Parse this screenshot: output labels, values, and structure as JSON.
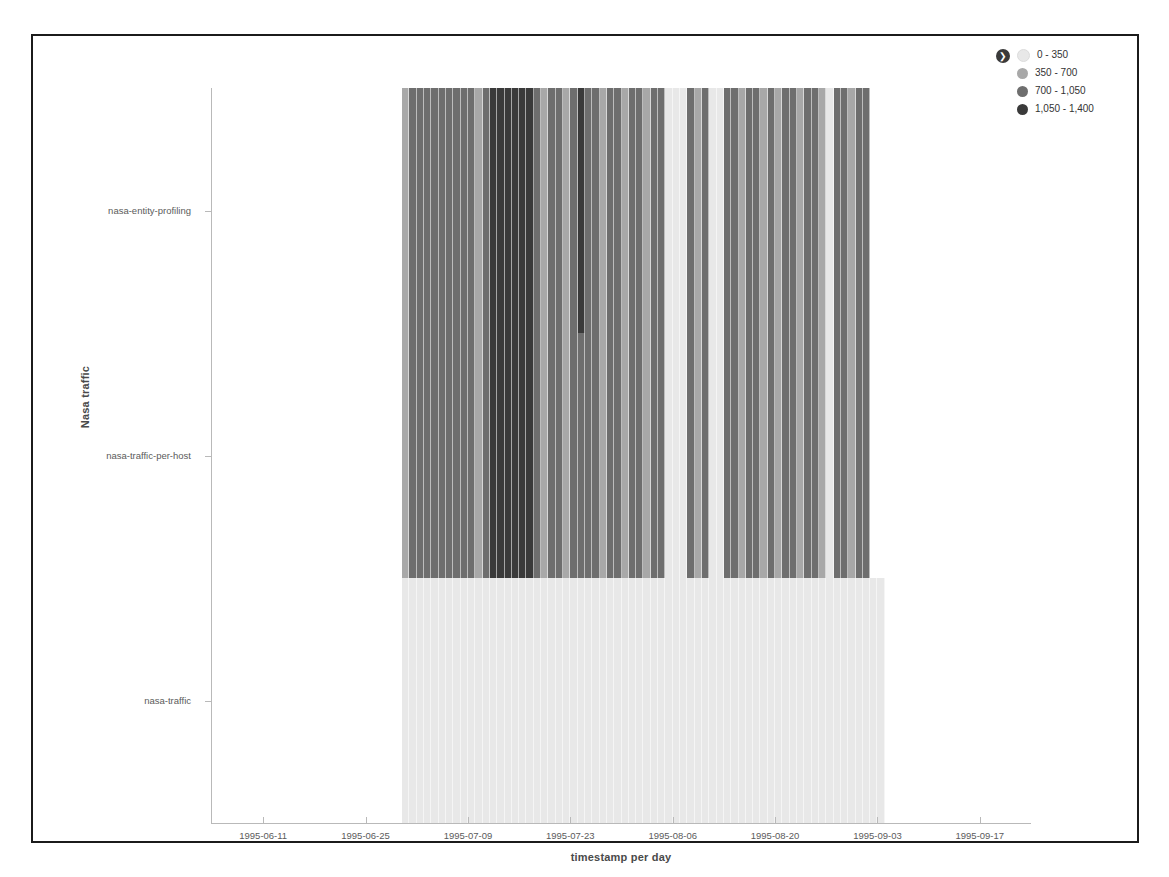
{
  "chart_data": {
    "type": "heatmap",
    "title": "",
    "xlabel": "timestamp per day",
    "ylabel": "Nasa traffic",
    "grid": false,
    "legend_position": "top-right",
    "x_tick_labels": [
      "1995-06-11",
      "1995-06-25",
      "1995-07-09",
      "1995-07-23",
      "1995-08-06",
      "1995-08-20",
      "1995-09-03",
      "1995-09-17"
    ],
    "x_axis_range": [
      "1995-06-04",
      "1995-09-24"
    ],
    "y_categories": [
      "nasa-entity-profiling",
      "nasa-traffic-per-host",
      "nasa-traffic"
    ],
    "value_unit": "requests",
    "color_bands": [
      {
        "label": "0 - 350",
        "min": 0,
        "max": 350,
        "color": "#e8e8e8"
      },
      {
        "label": "350 - 700",
        "min": 350,
        "max": 700,
        "color": "#a8a8a8"
      },
      {
        "label": "700 - 1,050",
        "min": 700,
        "max": 1050,
        "color": "#6e6e6e"
      },
      {
        "label": "1,050 - 1,400",
        "min": 1050,
        "max": 1400,
        "color": "#3a3a3a"
      }
    ],
    "data_start_date": "1995-06-30",
    "data_end_date": "1995-09-01",
    "series": [
      {
        "name": "nasa-entity-profiling",
        "values": [
          640,
          700,
          1010,
          1020,
          1030,
          1010,
          1000,
          1020,
          1040,
          1020,
          680,
          700,
          1060,
          1080,
          1100,
          1120,
          1300,
          1320,
          700,
          690,
          710,
          700,
          690,
          700,
          1080,
          700,
          700,
          690,
          700,
          700,
          690,
          700,
          700,
          690,
          700,
          700,
          330,
          300,
          320,
          700,
          690,
          700,
          300,
          310,
          700,
          700,
          690,
          700,
          700,
          690,
          700,
          690,
          700,
          700,
          690,
          700,
          700,
          690,
          320,
          700,
          700,
          690,
          1030,
          1040
        ]
      },
      {
        "name": "nasa-traffic-per-host",
        "values": [
          640,
          700,
          1010,
          1020,
          1030,
          1010,
          1000,
          1020,
          1040,
          1020,
          680,
          700,
          1060,
          1080,
          1100,
          1120,
          1300,
          1320,
          700,
          690,
          710,
          700,
          690,
          700,
          700,
          700,
          700,
          690,
          700,
          700,
          690,
          700,
          700,
          690,
          700,
          700,
          330,
          300,
          320,
          700,
          690,
          700,
          300,
          310,
          700,
          700,
          690,
          700,
          700,
          690,
          700,
          690,
          700,
          700,
          690,
          700,
          700,
          690,
          320,
          700,
          700,
          690,
          1030,
          1040
        ]
      },
      {
        "name": "nasa-traffic",
        "values": [
          120,
          130,
          125,
          140,
          135,
          120,
          130,
          128,
          132,
          126,
          118,
          124,
          136,
          142,
          138,
          130,
          127,
          133,
          129,
          124,
          131,
          126,
          135,
          128,
          130,
          127,
          133,
          125,
          129,
          134,
          126,
          131,
          128,
          130,
          124,
          127,
          110,
          105,
          112,
          128,
          131,
          126,
          104,
          108,
          130,
          127,
          133,
          126,
          129,
          124,
          131,
          127,
          130,
          126,
          128,
          133,
          125,
          129,
          112,
          130,
          127,
          126,
          132,
          128,
          125,
          130
        ]
      }
    ]
  },
  "legend": {
    "toggle_icon": "❯",
    "items": [
      {
        "label": "0 - 350",
        "color": "#e8e8e8"
      },
      {
        "label": "350 - 700",
        "color": "#a8a8a8"
      },
      {
        "label": "700 - 1,050",
        "color": "#6e6e6e"
      },
      {
        "label": "1,050 - 1,400",
        "color": "#3a3a3a"
      }
    ]
  }
}
